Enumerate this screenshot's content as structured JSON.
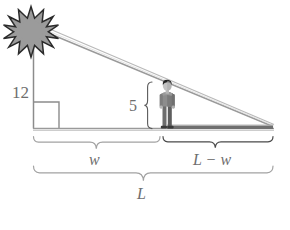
{
  "diagram": {
    "type": "geometry-similar-triangles",
    "canvas": {
      "width": 290,
      "height": 230,
      "background": "#ffffff"
    },
    "colors": {
      "star_fill": "#9b9b9b",
      "star_outline": "#2b2b2b",
      "line_gray": "#8c8c8c",
      "line_light": "#b4b4b4",
      "shadow_dark": "#6b6b6b",
      "label_gray": "#6e6e6e",
      "brace_gray": "#9a9a9a",
      "person_dark": "#4a4a4a",
      "person_mid": "#8f8f8f",
      "person_light": "#b9b9b9",
      "right_angle": "#8c8c8c"
    },
    "labels": {
      "pole_height": "12",
      "person_height": "5",
      "shadow_near": "w",
      "shadow_far": "L − w",
      "total_length": "L"
    },
    "icons": {
      "light_source": "sun-star-icon",
      "figure": "standing-person-icon"
    },
    "geometry": {
      "ground_y": 128,
      "pole_x": 33,
      "pole_top_y": 46,
      "star_center": [
        31,
        32
      ],
      "star_points": 12,
      "apex_right": [
        272,
        128
      ],
      "person_x": 167,
      "person_top_y": 82,
      "right_angle_size": 26
    }
  }
}
